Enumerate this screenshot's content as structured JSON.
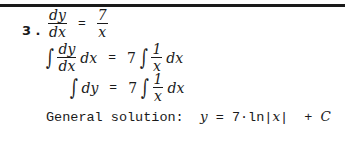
{
  "problem": {
    "number": "3 .",
    "line1": {
      "lhs_num": "dy",
      "lhs_den": "dx",
      "equals": "=",
      "rhs_num": "7",
      "rhs_den": "x"
    },
    "line2": {
      "integral": "∫",
      "lhs_num": "dy",
      "lhs_den": "dx",
      "lhs_tail": "dx",
      "equals": "=",
      "coef": "7",
      "rhs_num": "1",
      "rhs_den": "x",
      "rhs_tail": "dx"
    },
    "line3": {
      "integral": "∫",
      "lhs": "dy",
      "equals": "=",
      "coef": "7",
      "rhs_num": "1",
      "rhs_den": "x",
      "rhs_tail": "dx"
    },
    "solution": {
      "label": "General solution:  ",
      "y": "y",
      "eq": " = 7·ln|",
      "x": "x",
      "tail": "|  + ",
      "c": "C"
    }
  }
}
